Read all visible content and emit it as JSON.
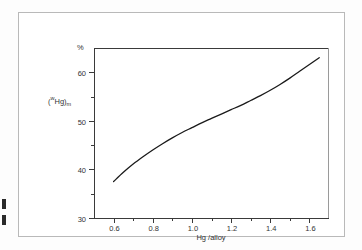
{
  "figure": {
    "unit_label": "%",
    "y_axis_title_main": "w",
    "y_axis_title_sup": "",
    "y_axis_title_sub_1": "Hg",
    "y_axis_title_sub_2": "m",
    "x_axis_title": "Hg /alloy"
  },
  "chart_data": {
    "type": "line",
    "title": "",
    "subtitle": "",
    "xlabel": "Hg /alloy",
    "ylabel": "(wHg)m",
    "yunit": "%",
    "xlim": [
      0.5,
      1.7
    ],
    "ylim": [
      30,
      65
    ],
    "grid": false,
    "legend": "none",
    "x_ticks": [
      0.6,
      0.8,
      1.0,
      1.2,
      1.4,
      1.6
    ],
    "x_tick_labels": [
      "0.6",
      "0.8",
      "1.0",
      "1.2",
      "1.4",
      "1.6"
    ],
    "x_minor_ticks": [
      0.7,
      0.9,
      1.1,
      1.3,
      1.5
    ],
    "y_ticks": [
      30,
      40,
      50,
      60
    ],
    "y_tick_labels": [
      "30",
      "40",
      "50",
      "60"
    ],
    "y_minor_ticks": [
      35,
      45,
      55
    ],
    "series": [
      {
        "name": "Hg mass fraction in amalgam",
        "color": "#1a1a1a",
        "x": [
          0.6,
          0.65,
          0.7,
          0.75,
          0.8,
          0.85,
          0.9,
          0.95,
          1.0,
          1.05,
          1.1,
          1.15,
          1.2,
          1.25,
          1.3,
          1.35,
          1.4,
          1.45,
          1.5,
          1.55,
          1.6,
          1.65
        ],
        "y": [
          37.5,
          39.4,
          41.1,
          42.6,
          44.0,
          45.3,
          46.5,
          47.6,
          48.6,
          49.6,
          50.5,
          51.4,
          52.3,
          53.2,
          54.2,
          55.2,
          56.3,
          57.5,
          58.8,
          60.2,
          61.6,
          63.0
        ]
      }
    ]
  }
}
